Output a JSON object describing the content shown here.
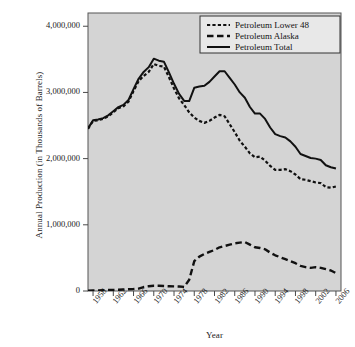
{
  "chart_data": {
    "type": "line",
    "title": "",
    "xlabel": "Year",
    "ylabel": "Annual Production (in Thousands of Barrels)",
    "xlim": [
      1957,
      2007
    ],
    "ylim": [
      0,
      4200000
    ],
    "grid": false,
    "legend_position": "top-right",
    "x_tick_labels": [
      "1958",
      "1962",
      "1966",
      "1970",
      "1974",
      "1978",
      "1982",
      "1986",
      "1990",
      "1994",
      "1998",
      "2002",
      "2006"
    ],
    "y_tick_labels": [
      "0",
      "1,000,000",
      "2,000,000",
      "3,000,000",
      "4,000,000"
    ],
    "y_tick_values": [
      0,
      1000000,
      2000000,
      3000000,
      4000000
    ],
    "x": [
      1957,
      1958,
      1959,
      1960,
      1961,
      1962,
      1963,
      1964,
      1965,
      1966,
      1967,
      1968,
      1969,
      1970,
      1971,
      1972,
      1973,
      1974,
      1975,
      1976,
      1977,
      1978,
      1979,
      1980,
      1981,
      1982,
      1983,
      1984,
      1985,
      1986,
      1987,
      1988,
      1989,
      1990,
      1991,
      1992,
      1993,
      1994,
      1995,
      1996,
      1997,
      1998,
      1999,
      2000,
      2001,
      2002,
      2003,
      2004,
      2005,
      2006
    ],
    "series": [
      {
        "name": "Petroleum Lower 48",
        "style": "dotted",
        "values": [
          2450000,
          2570000,
          2580000,
          2600000,
          2640000,
          2700000,
          2760000,
          2790000,
          2860000,
          3020000,
          3170000,
          3250000,
          3310000,
          3430000,
          3400000,
          3390000,
          3230000,
          3060000,
          2910000,
          2810000,
          2700000,
          2620000,
          2570000,
          2540000,
          2570000,
          2620000,
          2660000,
          2640000,
          2520000,
          2400000,
          2270000,
          2180000,
          2080000,
          2020000,
          2030000,
          1970000,
          1890000,
          1830000,
          1830000,
          1840000,
          1810000,
          1760000,
          1690000,
          1680000,
          1660000,
          1640000,
          1630000,
          1570000,
          1560000,
          1580000
        ]
      },
      {
        "name": "Petroleum Alaska",
        "style": "dashed",
        "values": [
          5000,
          8000,
          10000,
          12000,
          14000,
          16000,
          18000,
          22000,
          26000,
          30000,
          36000,
          60000,
          72000,
          80000,
          80000,
          75000,
          72000,
          70000,
          68000,
          62000,
          170000,
          450000,
          520000,
          560000,
          590000,
          620000,
          660000,
          680000,
          700000,
          720000,
          730000,
          740000,
          700000,
          660000,
          650000,
          630000,
          580000,
          540000,
          510000,
          480000,
          450000,
          420000,
          380000,
          360000,
          350000,
          360000,
          350000,
          330000,
          310000,
          270000
        ]
      },
      {
        "name": "Petroleum Total",
        "style": "solid",
        "values": [
          2455000,
          2578000,
          2590000,
          2612000,
          2654000,
          2716000,
          2778000,
          2812000,
          2886000,
          3050000,
          3206000,
          3310000,
          3382000,
          3510000,
          3480000,
          3465000,
          3302000,
          3130000,
          2978000,
          2872000,
          2870000,
          3070000,
          3090000,
          3100000,
          3160000,
          3240000,
          3320000,
          3320000,
          3220000,
          3120000,
          3000000,
          2920000,
          2780000,
          2680000,
          2680000,
          2600000,
          2470000,
          2370000,
          2340000,
          2320000,
          2260000,
          2180000,
          2070000,
          2040000,
          2010000,
          2000000,
          1980000,
          1900000,
          1870000,
          1850000
        ]
      }
    ],
    "legend": [
      {
        "label": "Petroleum Lower 48",
        "style": "dotted"
      },
      {
        "label": "Petroleum Alaska",
        "style": "dashed"
      },
      {
        "label": "Petroleum Total",
        "style": "solid"
      }
    ],
    "colors": {
      "line": "#111111",
      "plot_background": "#d4d4d4",
      "page_background": "#ffffff",
      "axis": "#4a4a4a"
    }
  }
}
